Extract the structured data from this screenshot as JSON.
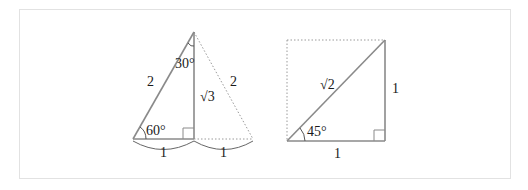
{
  "figure": {
    "left_triangle": {
      "hypotenuse_label": "2",
      "mirror_hypotenuse_label": "2",
      "height_label": "√3",
      "top_angle_label": "30°",
      "bottom_angle_label": "60°",
      "base_left_label": "1",
      "base_right_label": "1"
    },
    "right_triangle": {
      "hypotenuse_label": "√2",
      "side_label": "1",
      "base_label": "1",
      "angle_label": "45°"
    },
    "colors": {
      "solid_line": "#8a8a8a",
      "dotted_line": "#9a9a9a",
      "text": "#1a1a1a",
      "frame_border": "#e2e2e2"
    }
  }
}
